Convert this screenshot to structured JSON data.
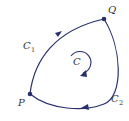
{
  "diagram": {
    "type": "closed-contour",
    "colors": {
      "curve": "#27306b",
      "text": "#333333",
      "background": "#ffffff"
    },
    "points": [
      {
        "id": "P",
        "label": "P",
        "x": 30,
        "y": 94
      },
      {
        "id": "Q",
        "label": "Q",
        "x": 104,
        "y": 19
      }
    ],
    "curves": [
      {
        "id": "C1",
        "label_main": "C",
        "label_sub": "1",
        "from": "P",
        "to": "Q",
        "side": "upper-left"
      },
      {
        "id": "C2",
        "label_main": "C",
        "label_sub": "2",
        "from": "Q",
        "to": "P",
        "side": "lower-right"
      }
    ],
    "center_label": "C",
    "orientation": "clockwise"
  }
}
